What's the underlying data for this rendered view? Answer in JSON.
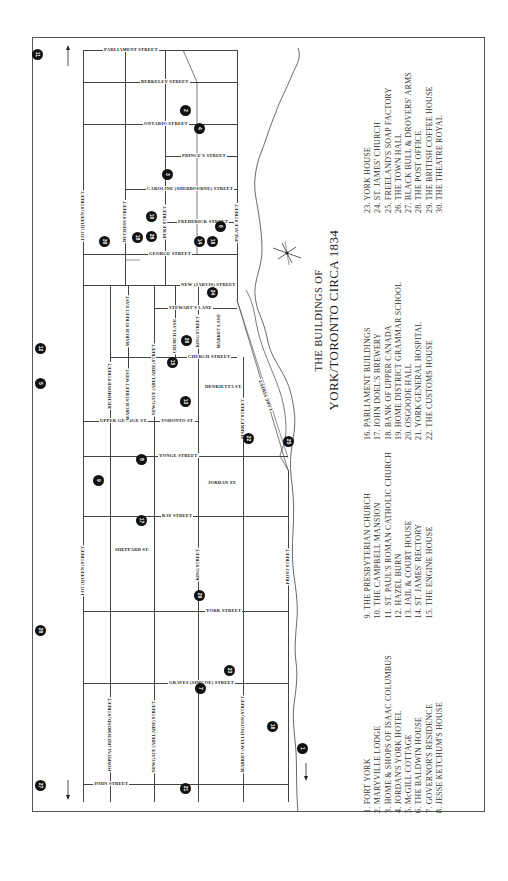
{
  "title": {
    "line1": "THE BUILDINGS OF",
    "line2": "YORK/TORONTO CIRCA 1834"
  },
  "streets": {
    "parliament": "PARLIAMENT STREET",
    "berkeley": "BERKELEY STREET",
    "ontario": "ONTARIO STREET",
    "princes": "PRINCE'S STREET",
    "caroline": "CAROLINE (SHERBOURNE) STREET",
    "frederick": "FREDERICK STREET",
    "george": "GEORGE STREET",
    "new_jarvis": "NEW (JARVIS) STREET",
    "stewarts_lane": "STEWART'S LANE",
    "church": "CHURCH STREET",
    "henrietta": "HENRIETTA ST.",
    "upper_george": "UPPER GEORGE ST.",
    "toronto": "TORONTO ST.",
    "yonge": "YONGE STREET",
    "jordan": "JORDAN ST.",
    "bay": "BAY STREET",
    "sheppard": "SHEPPARD ST.",
    "york": "YORK STREET",
    "graves": "GRAVES (SIMCOE) STREET",
    "john": "JOHN STREET",
    "lot_queen_top": "LOT (QUEEN) STREET",
    "lot_queen_bottom": "LOT (QUEEN) STREET",
    "duchess": "DUCHESS STREET",
    "duke": "DUKE STREET",
    "palace": "PALACE STREET",
    "richmond": "RICHMOND STREET",
    "march_east": "MARCH STREET EAST",
    "march_west": "MARCH STREET WEST",
    "newgate": "NEWGATE (ADELAIDE) STREET",
    "newgate_bottom": "NEWGATE (ADELAIDE) STREET",
    "hospital": "HOSPITAL (RICHMOND) STREET",
    "church_lane": "CHURCH LANE",
    "king_top": "KING STREET",
    "king_bottom": "KING STREET",
    "market_lane": "MARKET LANE",
    "market_street": "MARKET STREET",
    "market_wellington": "MARKET (WELLINGTON) STREET",
    "front": "FRONT STREET",
    "lake": "LAKE STREET"
  },
  "markers": [
    {
      "n": "11",
      "x": 37,
      "y": 54
    },
    {
      "n": "2",
      "x": 185,
      "y": 110
    },
    {
      "n": "4",
      "x": 199,
      "y": 128
    },
    {
      "n": "3",
      "x": 167,
      "y": 174
    },
    {
      "n": "30",
      "x": 104,
      "y": 241
    },
    {
      "n": "18",
      "x": 137,
      "y": 237
    },
    {
      "n": "28",
      "x": 151,
      "y": 236
    },
    {
      "n": "10",
      "x": 151,
      "y": 216
    },
    {
      "n": "14",
      "x": 199,
      "y": 241
    },
    {
      "n": "19",
      "x": 212,
      "y": 241
    },
    {
      "n": "6",
      "x": 220,
      "y": 226
    },
    {
      "n": "24",
      "x": 212,
      "y": 292
    },
    {
      "n": "12",
      "x": 40,
      "y": 348
    },
    {
      "n": "5",
      "x": 40,
      "y": 383
    },
    {
      "n": "15",
      "x": 172,
      "y": 362
    },
    {
      "n": "26",
      "x": 186,
      "y": 340
    },
    {
      "n": "13",
      "x": 185,
      "y": 401
    },
    {
      "n": "22",
      "x": 248,
      "y": 438
    },
    {
      "n": "25",
      "x": 288,
      "y": 441
    },
    {
      "n": "8",
      "x": 141,
      "y": 459
    },
    {
      "n": "9",
      "x": 98,
      "y": 480
    },
    {
      "n": "17",
      "x": 141,
      "y": 520
    },
    {
      "n": "29",
      "x": 199,
      "y": 595
    },
    {
      "n": "20",
      "x": 40,
      "y": 630
    },
    {
      "n": "23",
      "x": 229,
      "y": 670
    },
    {
      "n": "7",
      "x": 200,
      "y": 688
    },
    {
      "n": "16",
      "x": 272,
      "y": 726
    },
    {
      "n": "1",
      "x": 302,
      "y": 748
    },
    {
      "n": "27",
      "x": 40,
      "y": 785
    },
    {
      "n": "21",
      "x": 185,
      "y": 788
    }
  ],
  "legend": {
    "col1": [
      "1. FORT YORK",
      "2. MARYVILLE LODGE",
      "3. HOME & SHOPS OF ISAAC COLUMBUS",
      "4. JORDAN'S YORK HOTEL",
      "5. McGILL COTTAGE",
      "6. THE BALDWIN HOUSE",
      "7. GOVERNOR'S RESIDENCE",
      "8. JESSE KETCHUM'S HOUSE"
    ],
    "col2": [
      "9. THE PRESBYTERIAN CHURCH",
      "10. THE CAMPBELL MANSION",
      "11. ST. PAUL'S ROMAN CATHOLIC CHURCH",
      "12. HAZEL BURN",
      "13. JAIL & COURT HOUSE",
      "14. ST. JAMES' RECTORY",
      "15. THE ENGINE HOUSE"
    ],
    "col3": [
      "16. PARLIAMENT BUILDINGS",
      "17. JOHN DOEL'S BREWERY",
      "18. BANK OF UPPER CANADA",
      "19. HOME DISTRICT GRAMMAR SCHOOL",
      "20. OSGOODE HALL",
      "21. YORK GENERAL HOSPITAL",
      "22. THE CUSTOMS HOUSE"
    ],
    "col4": [
      "23. YORK HOUSE",
      "24. ST. JAMES' CHURCH",
      "25. FREELAND'S SOAP FACTORY",
      "26. THE TOWN HALL",
      "27. BLACK BULL & DROVERS' ARMS",
      "28. THE POST OFFICE",
      "29. THE BRITISH COFFEE HOUSE",
      "30. THE THEATRE ROYAL"
    ]
  }
}
